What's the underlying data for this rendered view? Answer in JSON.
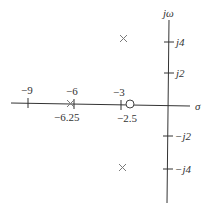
{
  "diagram": {
    "type": "pole-zero plot (s-plane)",
    "axes": {
      "real_label": "σ",
      "imag_label": "jω"
    },
    "real_ticks": [
      {
        "value": -9,
        "label": "−9"
      },
      {
        "value": -6,
        "label": "−6"
      },
      {
        "value": -3,
        "label": "−3"
      }
    ],
    "imag_ticks": [
      {
        "value": 4,
        "label": "j4"
      },
      {
        "value": 2,
        "label": "j2"
      },
      {
        "value": -2,
        "label": "−j2"
      },
      {
        "value": -4,
        "label": "−j4"
      }
    ],
    "poles": [
      {
        "re": -3,
        "im": 4.2
      },
      {
        "re": -3,
        "im": -4.2
      },
      {
        "re": -6.25,
        "im": 0,
        "label": "−6.25"
      }
    ],
    "zeros": [
      {
        "re": -2.5,
        "im": 0,
        "label": "−2.5"
      }
    ],
    "colors": {
      "axis": "#333333",
      "pole": "#7a7a7a",
      "zero": "#444444",
      "background": "#ffffff"
    }
  }
}
